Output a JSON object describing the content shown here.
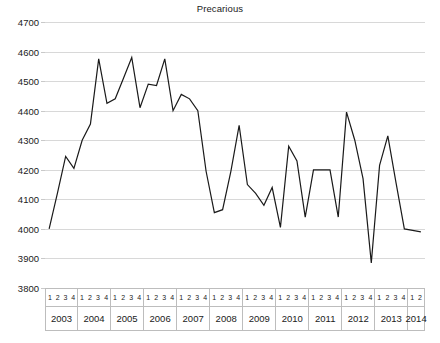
{
  "chart_data": {
    "type": "line",
    "title": "Precarious",
    "xlabel": "",
    "ylabel": "",
    "ylim": [
      3800,
      4700
    ],
    "ytick_step": 100,
    "yticks": [
      4700,
      4600,
      4500,
      4400,
      4300,
      4200,
      4100,
      4000,
      3900,
      3800
    ],
    "grid": true,
    "legend": null,
    "line_color": "#1a1a1a",
    "x_axis_style": "two-row table: quarter labels above year labels",
    "quarter_labels": [
      "1",
      "2",
      "3",
      "4"
    ],
    "year_groups": [
      {
        "year": "2003",
        "quarters": [
          "1",
          "2",
          "3",
          "4"
        ]
      },
      {
        "year": "2004",
        "quarters": [
          "1",
          "2",
          "3",
          "4"
        ]
      },
      {
        "year": "2005",
        "quarters": [
          "1",
          "2",
          "3",
          "4"
        ]
      },
      {
        "year": "2006",
        "quarters": [
          "1",
          "2",
          "3",
          "4"
        ]
      },
      {
        "year": "2007",
        "quarters": [
          "1",
          "2",
          "3",
          "4"
        ]
      },
      {
        "year": "2008",
        "quarters": [
          "1",
          "2",
          "3",
          "4"
        ]
      },
      {
        "year": "2009",
        "quarters": [
          "1",
          "2",
          "3",
          "4"
        ]
      },
      {
        "year": "2010",
        "quarters": [
          "1",
          "2",
          "3",
          "4"
        ]
      },
      {
        "year": "2011",
        "quarters": [
          "1",
          "2",
          "3",
          "4"
        ]
      },
      {
        "year": "2012",
        "quarters": [
          "1",
          "2",
          "3",
          "4"
        ]
      },
      {
        "year": "2013",
        "quarters": [
          "1",
          "2",
          "3",
          "4"
        ]
      },
      {
        "year": "2014",
        "quarters": [
          "1",
          "2"
        ]
      }
    ],
    "x": [
      "2003 Q1",
      "2003 Q2",
      "2003 Q3",
      "2003 Q4",
      "2004 Q1",
      "2004 Q2",
      "2004 Q3",
      "2004 Q4",
      "2005 Q1",
      "2005 Q2",
      "2005 Q3",
      "2005 Q4",
      "2006 Q1",
      "2006 Q2",
      "2006 Q3",
      "2006 Q4",
      "2007 Q1",
      "2007 Q2",
      "2007 Q3",
      "2007 Q4",
      "2008 Q1",
      "2008 Q2",
      "2008 Q3",
      "2008 Q4",
      "2009 Q1",
      "2009 Q2",
      "2009 Q3",
      "2009 Q4",
      "2010 Q1",
      "2010 Q2",
      "2010 Q3",
      "2010 Q4",
      "2011 Q1",
      "2011 Q2",
      "2011 Q3",
      "2011 Q4",
      "2012 Q1",
      "2012 Q2",
      "2012 Q3",
      "2012 Q4",
      "2013 Q1",
      "2013 Q2",
      "2013 Q3",
      "2013 Q4",
      "2014 Q1",
      "2014 Q2"
    ],
    "values": [
      4000,
      4120,
      4245,
      4205,
      4300,
      4355,
      4575,
      4425,
      4440,
      4510,
      4580,
      4410,
      4490,
      4485,
      4575,
      4400,
      4455,
      4440,
      4400,
      4195,
      4055,
      4065,
      4195,
      4350,
      4150,
      4120,
      4080,
      4140,
      4005,
      4280,
      4230,
      4040,
      4200,
      4200,
      4200,
      4040,
      4395,
      4300,
      4170,
      3885,
      4215,
      4315,
      4155,
      4000,
      3995,
      3990
    ]
  }
}
